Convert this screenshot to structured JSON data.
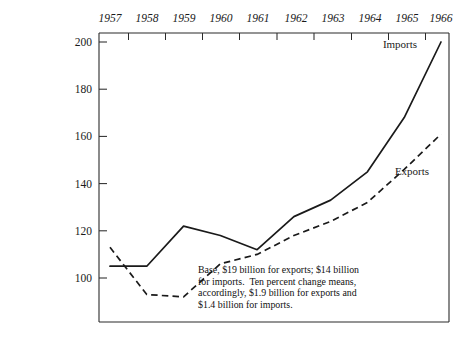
{
  "chart_data": {
    "type": "line",
    "title": "",
    "subtitle": "",
    "xlabel": "",
    "ylabel": "",
    "x": [
      1957,
      1958,
      1959,
      1960,
      1961,
      1962,
      1963,
      1964,
      1965,
      1966
    ],
    "xtick_labels": [
      "1957",
      "1958",
      "1959",
      "1960",
      "1961",
      "1962",
      "1963",
      "1964",
      "1965",
      "1966"
    ],
    "xlim": [
      1957,
      1966
    ],
    "ytick_labels": [
      "100",
      "120",
      "140",
      "160",
      "180",
      "200"
    ],
    "yticks": [
      100,
      120,
      140,
      160,
      180,
      200
    ],
    "ylim": [
      85,
      205
    ],
    "grid": false,
    "legend_position": "inline-labels",
    "xaxis_position": "top",
    "series": [
      {
        "name": "Imports",
        "style": "solid",
        "values": [
          105,
          105,
          122,
          118,
          112,
          126,
          133,
          145,
          168,
          200
        ]
      },
      {
        "name": "Exports",
        "style": "dashed",
        "values": [
          113,
          93,
          92,
          106,
          110,
          118,
          124,
          132,
          146,
          161
        ]
      }
    ],
    "annotations": [
      {
        "name": "base-note",
        "lines": [
          "Base, $19 billion for exports; $14 billion",
          "for imports.  Ten percent change means,",
          "accordingly, $1.9 billion for exports and",
          "$1.4 billion for imports."
        ]
      }
    ]
  },
  "labels": {
    "imports": "Imports",
    "exports": "Exports"
  },
  "colors": {
    "line": "#1a1a1a",
    "axis": "#2b2b2b",
    "background": "#ffffff"
  }
}
